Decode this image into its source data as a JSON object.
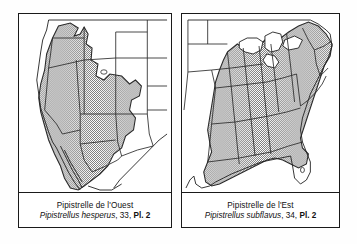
{
  "figure": {
    "type": "range-map-pair",
    "panels": [
      {
        "id": "west",
        "common_name": "Pipistrelle de l'Ouest",
        "scientific_name": "Pipistrellus hesperus",
        "entry_number": "33",
        "plate_label": "Pl. 2",
        "separator": ", ",
        "range_region": "western North America",
        "range_fill_color": "#8c8c8c",
        "outline_color": "#1a1a1a",
        "background_color": "#ffffff"
      },
      {
        "id": "east",
        "common_name": "Pipistrelle de l'Est",
        "scientific_name": "Pipistrellus subflavus",
        "entry_number": "34",
        "plate_label": "Pl. 2",
        "separator": ", ",
        "range_region": "eastern North America",
        "range_fill_color": "#8c8c8c",
        "outline_color": "#1a1a1a",
        "background_color": "#ffffff"
      }
    ]
  }
}
